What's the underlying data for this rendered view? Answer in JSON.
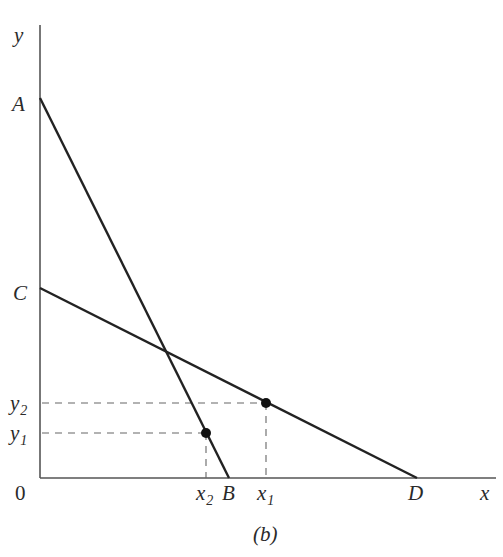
{
  "figure": {
    "caption": "(b)",
    "axes": {
      "y_label": "y",
      "x_label": "x",
      "origin_label": "0"
    },
    "lines": [
      {
        "name": "AB",
        "start_label": "A",
        "end_label": "B"
      },
      {
        "name": "CD",
        "start_label": "C",
        "end_label": "D"
      }
    ],
    "points": [
      {
        "name": "point-1",
        "x_label": "x",
        "x_sub": "1",
        "y_label": "y",
        "y_sub": "2",
        "on_line": "CD"
      },
      {
        "name": "point-2",
        "x_label": "x",
        "x_sub": "2",
        "y_label": "y",
        "y_sub": "1",
        "on_line": "AB"
      }
    ],
    "colors": {
      "axis": "#555555",
      "line": "#222222",
      "dashed": "#666666",
      "text": "#2a2a2a"
    }
  }
}
